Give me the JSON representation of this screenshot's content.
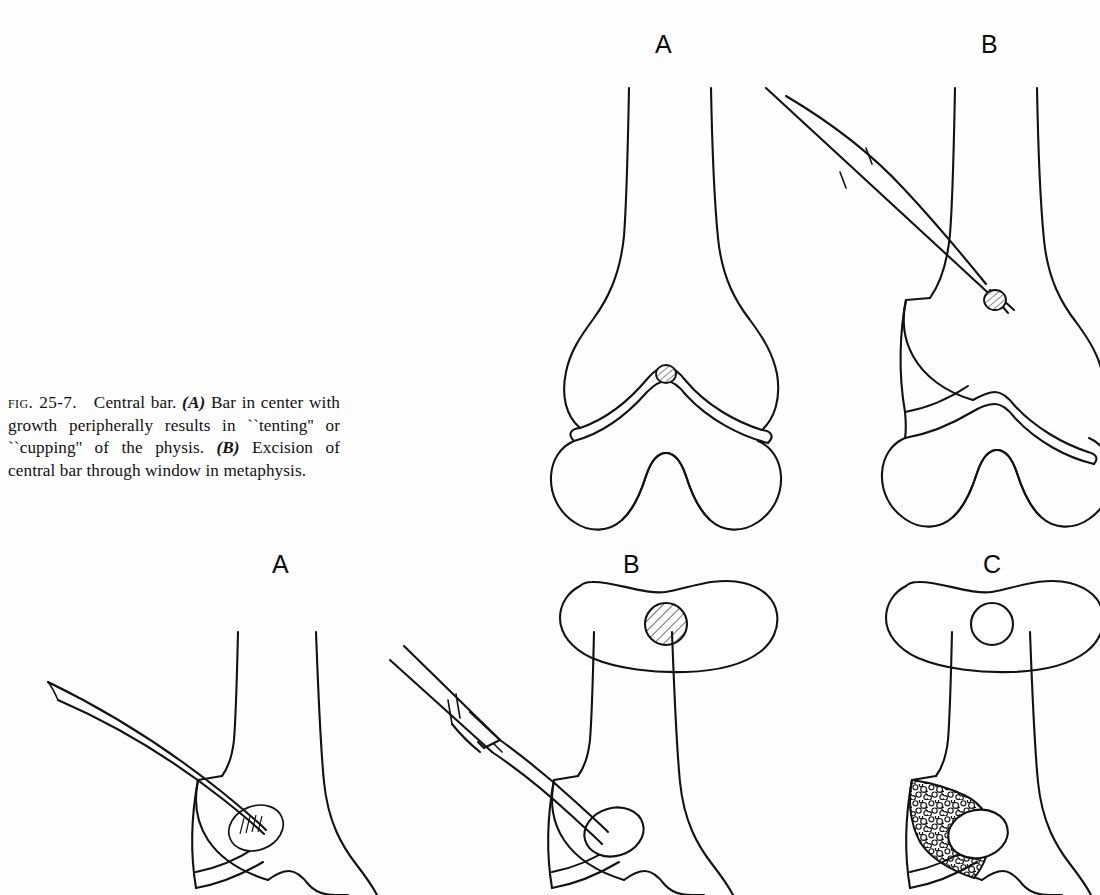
{
  "document": {
    "type": "textbook-figure-page",
    "background_color": "#ffffff",
    "ink_color": "#14110f"
  },
  "caption": {
    "figure_label": "Fig. 25-7.",
    "title": "Central bar.",
    "panel_a_ref": "(A)",
    "panel_a_text": "Bar in center with growth peripherally results in ``tenting'' or ``cupping'' of the physis.",
    "panel_b_ref": "(B)",
    "panel_b_text": "Excision of central bar through window in metaphysis.",
    "full_text": "Fig. 25-7.  Central bar. (A) Bar in center with growth peripherally results in ``tenting'' or ``cupping'' of the physis. (B) Excision of central bar through window in metaphysis."
  },
  "figure_top": {
    "row_id": "fig-25-7",
    "panels": [
      {
        "letter": "A",
        "label_x": 662,
        "label_y": 36,
        "description": "Distal femur coronal view with tented physis and hatched central bar; below, transverse cross-section of physis with hatched central bar circle",
        "bar_shading": "diagonal-hatch",
        "cross_section_circle": "hatched"
      },
      {
        "letter": "B",
        "label_x": 988,
        "label_y": 36,
        "description": "Distal femur with curette instrument passed through metaphyseal window reaching central bar; below, transverse cross-section showing empty circle where bar excised",
        "bar_shading": "diagonal-hatch",
        "cross_section_circle": "empty",
        "instrument": "curved curette"
      }
    ]
  },
  "figure_bottom": {
    "row_id": "fig-25-8",
    "panels": [
      {
        "letter": "A",
        "label_x": 280,
        "label_y": 556,
        "description": "Distal femur with long tapered curette creating metaphyseal window and cavity at the bar site",
        "instrument": "long tapered curette",
        "cavity": "oval with fine hatching"
      },
      {
        "letter": "B",
        "label_x": 630,
        "label_y": 556,
        "description": "Syringe-type injector with curved cannula filling the excision cavity with interposition material",
        "instrument": "syringe with curved cannula",
        "cavity": "filled oval"
      },
      {
        "letter": "C",
        "label_x": 990,
        "label_y": 556,
        "description": "Metaphyseal window packed with bone graft shown as stippled texture, cavity filled",
        "instrument": "none",
        "cavity": "bone-graft stipple"
      }
    ]
  }
}
